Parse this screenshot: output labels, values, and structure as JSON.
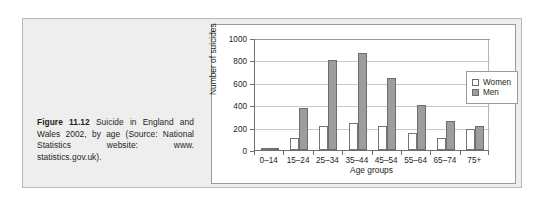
{
  "figure": {
    "caption_lead": "Figure 11.12",
    "caption_text": " Suicide in England and Wales 2002, by age (Source: National Statistics website: www. statistics.gov.uk)."
  },
  "legend": {
    "position": "right",
    "items": [
      {
        "label": "Women",
        "color": "#ffffff"
      },
      {
        "label": "Men",
        "color": "#9d9d9d"
      }
    ]
  },
  "chart_data": {
    "type": "bar",
    "title": "",
    "xlabel": "Age groups",
    "ylabel": "Number of suicides",
    "categories": [
      "0–14",
      "15–24",
      "25–34",
      "35–44",
      "45–54",
      "55–64",
      "65–74",
      "75+"
    ],
    "series": [
      {
        "name": "Women",
        "color": "#ffffff",
        "values": [
          10,
          105,
          215,
          245,
          210,
          150,
          110,
          185
        ]
      },
      {
        "name": "Men",
        "color": "#9d9d9d",
        "values": [
          12,
          375,
          800,
          865,
          645,
          400,
          255,
          210
        ]
      }
    ],
    "ylim": [
      0,
      1000
    ],
    "yticks": [
      0,
      200,
      400,
      600,
      800,
      1000
    ],
    "ytick_labels": [
      "0",
      "200",
      "400",
      "600",
      "800",
      "1000"
    ],
    "grid": true,
    "grid_axis": "y"
  }
}
